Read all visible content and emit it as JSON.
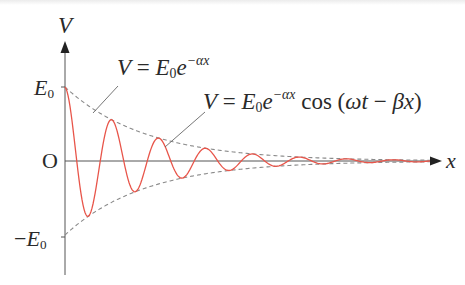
{
  "figure": {
    "axes": {
      "y_label": "V",
      "x_label": "x",
      "origin_label": "O",
      "upper_tick_label": "E0",
      "lower_tick_label": "-E0"
    },
    "annotations": {
      "envelope_formula": {
        "lhs": "V",
        "eq": "=",
        "base": "E",
        "sub": "0",
        "exp_base": "e",
        "exponent": "−αx"
      },
      "wave_formula": {
        "lhs": "V",
        "eq": "=",
        "base": "E",
        "sub": "0",
        "exp_base": "e",
        "exponent": "−αx",
        "tail": "cos (ωt − βx)"
      }
    },
    "colors": {
      "wave": "#e8554a",
      "envelope": "#8a8a8a",
      "axis": "#555555",
      "text": "#2a2a2a"
    },
    "labels_text": {
      "V": "V",
      "x": "x",
      "O": "O",
      "E": "E",
      "zero": "0",
      "minus": "−",
      "equals": "=",
      "e": "e",
      "exp": "−αx",
      "cos": "cos (",
      "omega_t": "ωt",
      "minus_beta": " − ",
      "beta_x": "βx",
      "close": ")"
    }
  }
}
